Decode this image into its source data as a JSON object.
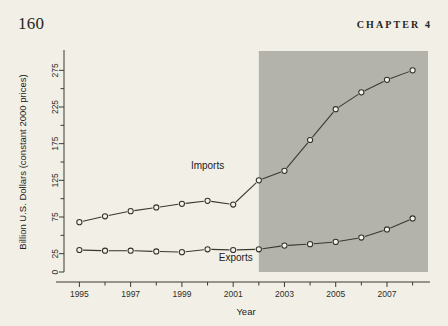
{
  "header": {
    "page_number": "160",
    "chapter_label": "CHAPTER 4"
  },
  "chart_data": {
    "type": "line",
    "title": "",
    "xlabel": "Year",
    "ylabel": "Billion U.S. Dollars (constant 2000 prices)",
    "x": [
      1995,
      1996,
      1997,
      1998,
      1999,
      2000,
      2001,
      2002,
      2003,
      2004,
      2005,
      2006,
      2007,
      2008
    ],
    "xlim": [
      1994.4,
      2008.6
    ],
    "ylim": [
      0,
      300
    ],
    "x_tick_values": [
      1995,
      1996,
      1997,
      1998,
      1999,
      2000,
      2001,
      2002,
      2003,
      2004,
      2005,
      2006,
      2007,
      2008
    ],
    "x_tick_labels": [
      "1995",
      "",
      "1997",
      "",
      "1999",
      "",
      "2001",
      "",
      "2003",
      "",
      "2005",
      "",
      "2007",
      ""
    ],
    "y_tick_values": [
      0,
      25,
      50,
      75,
      100,
      125,
      150,
      175,
      200,
      225,
      250,
      275
    ],
    "y_tick_labels": [
      "0",
      "25",
      "",
      "75",
      "",
      "125",
      "",
      "175",
      "",
      "225",
      "",
      "275"
    ],
    "grid": false,
    "legend_position": "inline-annotation",
    "series": [
      {
        "name": "Imports",
        "label_x": 2000.0,
        "label_y": 140,
        "values": [
          68,
          76,
          83,
          88,
          93,
          97,
          92,
          125,
          138,
          180,
          222,
          245,
          262,
          275
        ]
      },
      {
        "name": "Exports",
        "label_x": 2001.1,
        "label_y": 15,
        "values": [
          30,
          29,
          29,
          28,
          27,
          31,
          30,
          31,
          36,
          38,
          41,
          47,
          58,
          73
        ]
      }
    ],
    "annotations": [
      {
        "type": "shaded-span",
        "x_start": 2002,
        "x_end": 2008.6,
        "color": "#b4b3ab"
      }
    ],
    "colors": {
      "background": "#f2f0e6",
      "line": "#3a382f",
      "marker_fill": "#f4f2e8",
      "shade": "#b4b3ab",
      "axis": "#3b3a34"
    }
  }
}
